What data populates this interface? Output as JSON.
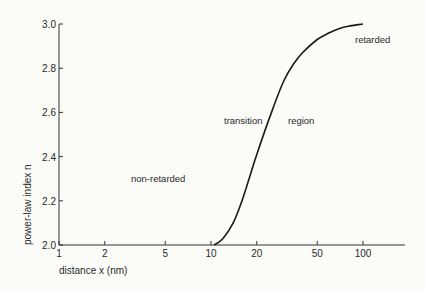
{
  "chart_data": {
    "type": "line",
    "title": "",
    "xlabel": "distance x (nm)",
    "ylabel": "power-law index n",
    "xscale": "log",
    "xlim": [
      1,
      200
    ],
    "ylim": [
      2.0,
      3.0
    ],
    "xticks": [
      "1",
      "2",
      "5",
      "10",
      "20",
      "50",
      "100"
    ],
    "yticks": [
      "2.0",
      "2.2",
      "2.4",
      "2.6",
      "2.8",
      "3.0"
    ],
    "grid": false,
    "legend": null,
    "series": [
      {
        "name": "n(x)",
        "x": [
          10.5,
          12,
          14,
          16,
          18,
          20,
          25,
          30,
          35,
          40,
          50,
          60,
          70,
          80,
          100
        ],
        "y": [
          2.0,
          2.03,
          2.1,
          2.2,
          2.31,
          2.41,
          2.6,
          2.74,
          2.82,
          2.87,
          2.93,
          2.96,
          2.98,
          2.99,
          3.0
        ]
      }
    ],
    "annotations": [
      {
        "text": "non-retarded",
        "x": 2.6,
        "y": 2.19
      },
      {
        "text": "transition",
        "x": 17,
        "y": 2.53
      },
      {
        "text": "region",
        "x": 33,
        "y": 2.53
      },
      {
        "text": "retarded",
        "x": 105,
        "y": 2.96
      }
    ]
  },
  "labels": {
    "xlabel": "distance x (nm)",
    "ylabel": "power-law index n",
    "non_retarded": "non-retarded",
    "transition": "transition",
    "region": "region",
    "retarded": "retarded"
  }
}
